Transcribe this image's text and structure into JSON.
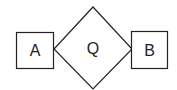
{
  "diagram": {
    "type": "er-diagram",
    "entities": [
      {
        "id": "A",
        "label": "A",
        "shape": "rectangle",
        "x": 16,
        "y": 32,
        "width": 37,
        "height": 36
      },
      {
        "id": "B",
        "label": "B",
        "shape": "rectangle",
        "x": 131,
        "y": 31,
        "width": 36,
        "height": 37
      }
    ],
    "relationships": [
      {
        "id": "Q",
        "label": "Q",
        "shape": "diamond",
        "cx": 93,
        "cy": 49,
        "half_width": 39,
        "half_height": 42,
        "connects": [
          "A",
          "B"
        ]
      }
    ],
    "colors": {
      "stroke": "#222222",
      "fill": "#ffffff",
      "text": "#222222"
    }
  }
}
